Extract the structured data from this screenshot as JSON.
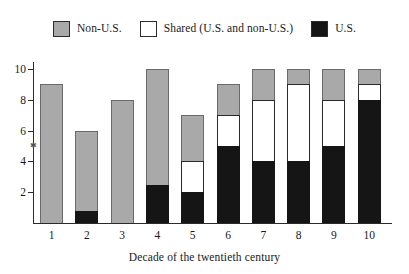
{
  "chart_data": {
    "type": "bar",
    "subtype": "stacked-bar",
    "title": "",
    "xlabel": "Decade of the twentieth century",
    "ylabel": "",
    "categories": [
      "1",
      "2",
      "3",
      "4",
      "5",
      "6",
      "7",
      "8",
      "9",
      "10"
    ],
    "ylim": [
      0,
      10
    ],
    "yticks": [
      2,
      4,
      6,
      8,
      10
    ],
    "ytick_labels": [
      "2",
      "4",
      "6",
      "8",
      "10"
    ],
    "grid": false,
    "legend_position": "top",
    "series": [
      {
        "name": "U.S.",
        "color": "#151515",
        "values": [
          0,
          0.75,
          0,
          2.5,
          2,
          5,
          4,
          4,
          5,
          8
        ]
      },
      {
        "name": "Shared (U.S. and non-U.S.)",
        "color": "#ffffff",
        "values": [
          0,
          0,
          0,
          0,
          2,
          2,
          4,
          5,
          3,
          1
        ]
      },
      {
        "name": "Non-U.S.",
        "color": "#a9a9a9",
        "values": [
          9,
          5.25,
          8,
          7.5,
          3,
          2,
          2,
          1,
          2,
          1
        ]
      }
    ],
    "totals": [
      9,
      6,
      8,
      10,
      7,
      9,
      10,
      10,
      10,
      10
    ]
  },
  "legend": {
    "entries": [
      {
        "label": "Non-U.S.",
        "swatch": "#a9a9a9"
      },
      {
        "label": "Shared (U.S. and non-U.S.)",
        "swatch": "#ffffff"
      },
      {
        "label": "U.S.",
        "swatch": "#151515"
      }
    ]
  },
  "axis": {
    "x_title": "Decade of the twentieth century",
    "y_ticks": [
      "10",
      "8",
      "6",
      "4",
      "2"
    ],
    "x_ticks": [
      "1",
      "2",
      "3",
      "4",
      "5",
      "6",
      "7",
      "8",
      "9",
      "10"
    ]
  }
}
